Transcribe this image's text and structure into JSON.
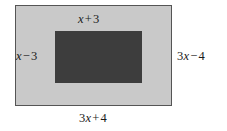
{
  "figure": {
    "type": "geometry-diagram",
    "colors": {
      "page_background": "#ffffff",
      "outer_rect_fill": "#c9c9c9",
      "outer_rect_border": "#555555",
      "inner_rect_fill": "#3d3d3d",
      "label_text": "#1a1a1a"
    },
    "labels": {
      "top": {
        "coefficient": "",
        "variable": "x",
        "operator": "+",
        "constant": "3",
        "text": "x + 3"
      },
      "left": {
        "coefficient": "",
        "variable": "x",
        "operator": "−",
        "constant": "3",
        "text": "x − 3"
      },
      "right": {
        "coefficient": "3",
        "variable": "x",
        "operator": "−",
        "constant": "4",
        "text": "3x − 4"
      },
      "bottom": {
        "coefficient": "3",
        "variable": "x",
        "operator": "+",
        "constant": "4",
        "text": "3x + 4"
      }
    }
  }
}
